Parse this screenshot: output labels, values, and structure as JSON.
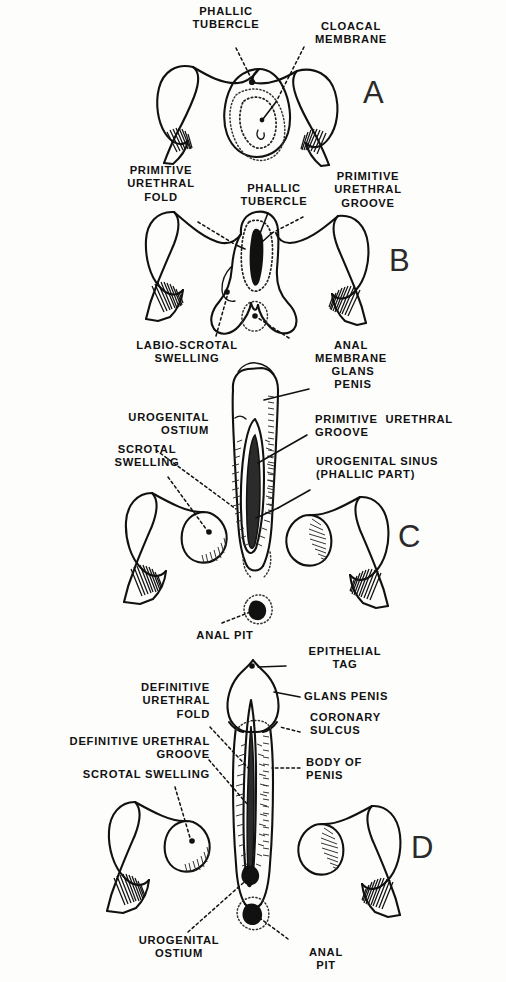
{
  "figure": {
    "background_color": "#fdfdfc",
    "ink_color": "#111111"
  },
  "panels": [
    {
      "id": "A",
      "letter": "A",
      "labels": [
        {
          "id": "a-phallic-tubercle",
          "text": "PHALLIC\nTUBERCLE"
        },
        {
          "id": "a-cloacal-membrane",
          "text": "CLOACAL\nMEMBRANE"
        }
      ]
    },
    {
      "id": "B",
      "letter": "B",
      "labels": [
        {
          "id": "b-primitive-urethral-fold",
          "text": "PRIMITIVE\nURETHRAL\nFOLD"
        },
        {
          "id": "b-phallic-tubercle",
          "text": "PHALLIC\nTUBERCLE"
        },
        {
          "id": "b-primitive-urethral-groove",
          "text": "PRIMITIVE\nURETHRAL\nGROOVE"
        },
        {
          "id": "b-labio-scrotal-swelling",
          "text": "LABIO-SCROTAL\nSWELLING"
        },
        {
          "id": "b-anal-membrane",
          "text": "ANAL\nMEMBRANE"
        }
      ]
    },
    {
      "id": "C",
      "letter": "C",
      "labels": [
        {
          "id": "c-glans-penis",
          "text": "GLANS\nPENIS"
        },
        {
          "id": "c-urogenital-ostium",
          "text": "UROGENITAL\nOSTIUM"
        },
        {
          "id": "c-scrotal-swelling",
          "text": "SCROTAL\nSWELLING"
        },
        {
          "id": "c-primitive-urethral-groove",
          "text": "PRIMITIVE  URETHRAL\nGROOVE"
        },
        {
          "id": "c-urogenital-sinus",
          "text": "UROGENITAL SINUS\n(PHALLIC PART)"
        },
        {
          "id": "c-anal-pit",
          "text": "ANAL PIT"
        }
      ]
    },
    {
      "id": "D",
      "letter": "D",
      "labels": [
        {
          "id": "d-epithelial-tag",
          "text": "EPITHELIAL\nTAG"
        },
        {
          "id": "d-glans-penis",
          "text": "GLANS PENIS"
        },
        {
          "id": "d-coronary-sulcus",
          "text": "CORONARY\nSULCUS"
        },
        {
          "id": "d-body-of-penis",
          "text": "BODY OF\nPENIS"
        },
        {
          "id": "d-definitive-urethral-fold",
          "text": "DEFINITIVE\nURETHRAL\nFOLD"
        },
        {
          "id": "d-definitive-urethral-groove",
          "text": "DEFINITIVE URETHRAL\nGROOVE"
        },
        {
          "id": "d-scrotal-swelling",
          "text": "SCROTAL SWELLING"
        },
        {
          "id": "d-urogenital-ostium",
          "text": "UROGENITAL\nOSTIUM"
        },
        {
          "id": "d-anal-pit",
          "text": "ANAL\nPIT"
        }
      ]
    }
  ],
  "labels": {
    "a_phallic_tubercle": "PHALLIC\nTUBERCLE",
    "a_cloacal_membrane": "CLOACAL\nMEMBRANE",
    "a_letter": "A",
    "b_primitive_urethral_fold": "PRIMITIVE\nURETHRAL\nFOLD",
    "b_phallic_tubercle": "PHALLIC\nTUBERCLE",
    "b_primitive_urethral_groove": "PRIMITIVE\nURETHRAL\nGROOVE",
    "b_labio_scrotal_swelling": "LABIO-SCROTAL\nSWELLING",
    "b_anal_membrane": "ANAL\nMEMBRANE",
    "b_letter": "B",
    "c_glans_penis": "GLANS\nPENIS",
    "c_urogenital_ostium": "UROGENITAL\nOSTIUM",
    "c_scrotal_swelling": "SCROTAL\nSWELLING",
    "c_primitive_urethral_groove": "PRIMITIVE  URETHRAL\nGROOVE",
    "c_urogenital_sinus": "UROGENITAL SINUS\n(PHALLIC PART)",
    "c_anal_pit": "ANAL PIT",
    "c_letter": "C",
    "d_epithelial_tag": "EPITHELIAL\nTAG",
    "d_glans_penis": "GLANS PENIS",
    "d_coronary_sulcus": "CORONARY\nSULCUS",
    "d_body_of_penis": "BODY OF\nPENIS",
    "d_definitive_urethral_fold": "DEFINITIVE\nURETHRAL\nFOLD",
    "d_definitive_urethral_groove": "DEFINITIVE URETHRAL\nGROOVE",
    "d_scrotal_swelling": "SCROTAL SWELLING",
    "d_urogenital_ostium": "UROGENITAL\nOSTIUM",
    "d_anal_pit": "ANAL\nPIT",
    "d_letter": "D"
  }
}
